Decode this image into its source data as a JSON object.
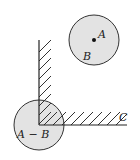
{
  "diagram": {
    "labels": {
      "point_a": "A",
      "region_b": "B",
      "minkowski_region": "A − B",
      "obstacle": "C"
    },
    "colors": {
      "disk_fill": "#e3e3e3",
      "stroke": "#333333",
      "background": "#ffffff"
    }
  }
}
